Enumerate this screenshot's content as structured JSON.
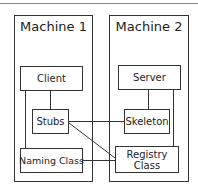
{
  "diagram": {
    "machines": [
      {
        "title": "Machine 1"
      },
      {
        "title": "Machine 2"
      }
    ],
    "nodes": {
      "client": "Client",
      "stubs": "Stubs",
      "naming": "Naming Class",
      "server": "Server",
      "skeleton": "Skeleton",
      "registry": "Registry Class"
    },
    "edges": [
      [
        "Client",
        "Stubs"
      ],
      [
        "Client",
        "Naming Class"
      ],
      [
        "Stubs",
        "Skeleton"
      ],
      [
        "Stubs",
        "Registry Class"
      ],
      [
        "Naming Class",
        "Registry Class"
      ],
      [
        "Server",
        "Skeleton"
      ],
      [
        "Server",
        "Registry Class"
      ]
    ]
  }
}
